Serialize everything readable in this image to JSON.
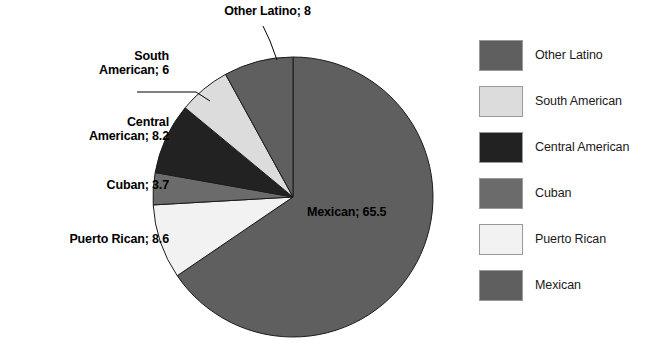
{
  "chart_data": {
    "type": "pie",
    "title": "",
    "xlabel": "",
    "ylabel": "",
    "unit": "percent",
    "legend_position": "right",
    "grid": false,
    "start_angle_deg": 0,
    "direction": "clockwise",
    "categories": [
      "Mexican",
      "Puerto Rican",
      "Cuban",
      "Central American",
      "South American",
      "Other Latino"
    ],
    "values": [
      65.5,
      8.6,
      3.7,
      8.2,
      6,
      8
    ],
    "slices": [
      {
        "name": "Mexican",
        "value": 65.5,
        "label": "Mexican; 65.5",
        "color": "#5f5f5f",
        "label_placement": "inside"
      },
      {
        "name": "Puerto Rican",
        "value": 8.6,
        "label": "Puerto Rican; 8.6",
        "color": "#f2f2f2",
        "label_placement": "outside-left"
      },
      {
        "name": "Cuban",
        "value": 3.7,
        "label": "Cuban; 3.7",
        "color": "#6b6b6b",
        "label_placement": "outside-left"
      },
      {
        "name": "Central American",
        "value": 8.2,
        "label": "Central American; 8.2",
        "color": "#222222",
        "label_placement": "outside-left"
      },
      {
        "name": "South American",
        "value": 6,
        "label": "South American; 6",
        "color": "#dcdcdc",
        "label_placement": "outside-left"
      },
      {
        "name": "Other Latino",
        "value": 8,
        "label": "Other Latino; 8",
        "color": "#5f5f5f",
        "label_placement": "outside-top"
      }
    ]
  },
  "callouts": {
    "other_latino": "Other Latino; 8",
    "south_american": "South\nAmerican; 6",
    "central_american": "Central\nAmerican; 8.2",
    "cuban": "Cuban; 3.7",
    "puerto_rican": "Puerto Rican; 8.6",
    "mexican": "Mexican; 65.5"
  },
  "legend": {
    "items": [
      {
        "label": "Other Latino",
        "color": "#5f5f5f"
      },
      {
        "label": "South American",
        "color": "#dcdcdc"
      },
      {
        "label": "Central American",
        "color": "#222222"
      },
      {
        "label": "Cuban",
        "color": "#6b6b6b"
      },
      {
        "label": "Puerto Rican",
        "color": "#f2f2f2"
      },
      {
        "label": "Mexican",
        "color": "#5f5f5f"
      }
    ]
  },
  "title_remnant": ""
}
